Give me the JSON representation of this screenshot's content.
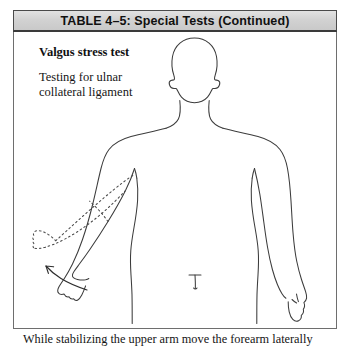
{
  "table": {
    "header_title": "TABLE 4–5: Special Tests (Continued)",
    "header_bg": "#d2d2d2",
    "header_border": "#4a4a4a",
    "frame_border": "#6e6e6e"
  },
  "content": {
    "test_name": "Valgus stress test",
    "test_description_line1": "Testing for ulnar",
    "test_description_line2": "collateral ligament"
  },
  "caption": {
    "text": "While stabilizing the upper arm move the forearm laterally"
  },
  "illustration": {
    "subject": "anterior view human body outline",
    "solid_outline_color": "#3c3c3c",
    "dotted_outline_color": "#4a4a4a",
    "arrow_color": "#2e2e2e",
    "description": "Front-facing body outline with left arm shown in solid line and the same forearm repeated as a dotted outline abducted laterally, with a curved arrow indicating direction of movement"
  }
}
